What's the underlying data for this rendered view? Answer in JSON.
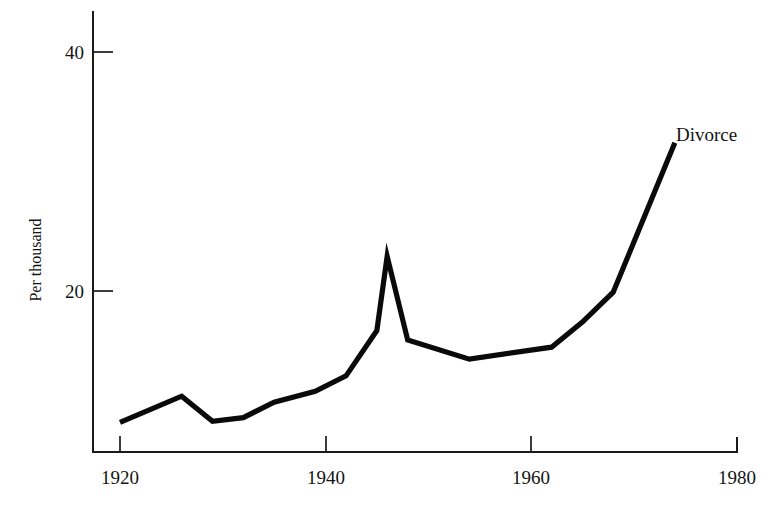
{
  "chart_data": {
    "type": "line",
    "title": "",
    "subtitle": "",
    "xlabel": "",
    "ylabel": "Per thousand",
    "xlim": [
      1918,
      1980
    ],
    "ylim": [
      8.3,
      41.5
    ],
    "grid": false,
    "legend_position": "inline-right-end",
    "x_ticks": [
      1920,
      1940,
      1960,
      1980
    ],
    "x_tick_labels": [
      "1920",
      "1940",
      "1960",
      "1980"
    ],
    "y_ticks": [
      20,
      40
    ],
    "y_tick_labels": [
      "20",
      "40"
    ],
    "series": [
      {
        "name": "Divorce",
        "label": "Divorce",
        "color": "#0a0a0a",
        "x": [
          1920,
          1926,
          1929,
          1932,
          1935,
          1939,
          1942,
          1945,
          1946,
          1948,
          1954,
          1962,
          1965,
          1968,
          1974
        ],
        "values": [
          9.0,
          11.2,
          9.1,
          9.4,
          10.7,
          11.6,
          12.9,
          16.7,
          22.9,
          15.9,
          14.3,
          15.3,
          17.4,
          19.9,
          32.4
        ]
      }
    ],
    "annotations": [
      {
        "text": "Divorce",
        "x": 1974,
        "y": 32.4
      }
    ]
  },
  "axes": {
    "y_axis_title": "Per thousand",
    "y_tick_40": "40",
    "y_tick_20": "20",
    "x_tick_1920": "1920",
    "x_tick_1940": "1940",
    "x_tick_1960": "1960",
    "x_tick_1980": "1980"
  },
  "series_label": {
    "divorce": "Divorce"
  },
  "colors": {
    "background": "#ffffff",
    "line": "#0a0a0a",
    "axis": "#1a1a1a",
    "text": "#141414"
  }
}
